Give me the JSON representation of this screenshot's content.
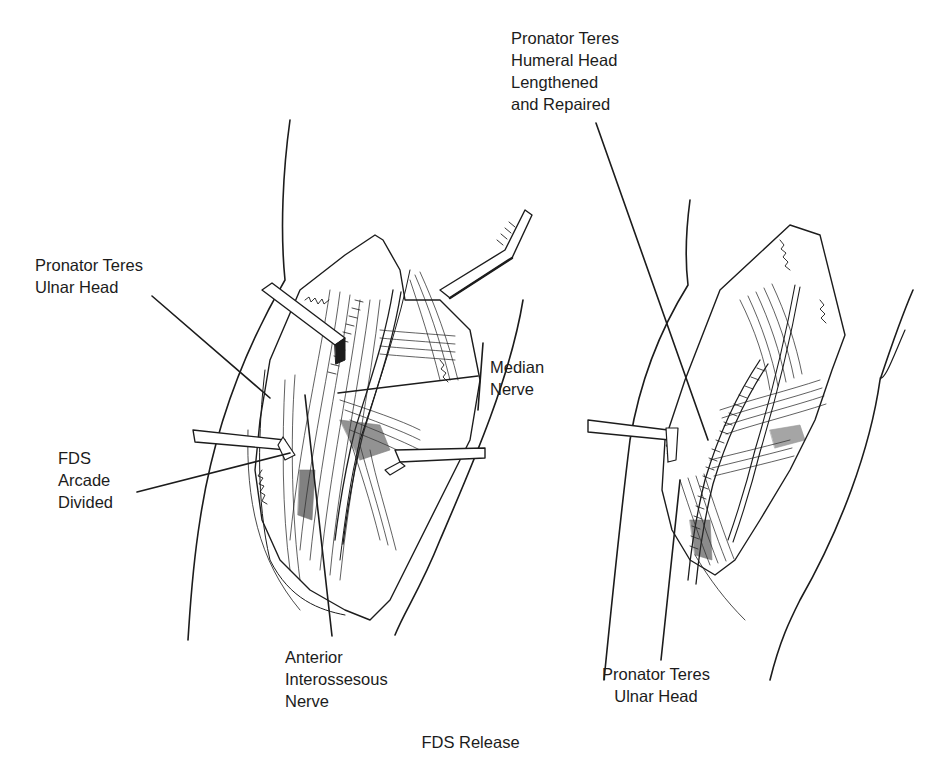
{
  "figure": {
    "caption": "FDS Release",
    "panels": [
      {
        "id": "left",
        "description": "Exposure before release",
        "labels": [
          {
            "id": "pronator-teres-ulnar-head-left",
            "lines": [
              "Pronator Teres",
              "Ulnar Head"
            ]
          },
          {
            "id": "fds-arcade-divided",
            "lines": [
              "FDS",
              "Arcade",
              "Divided"
            ]
          },
          {
            "id": "median-nerve",
            "lines": [
              "Median",
              "Nerve"
            ]
          },
          {
            "id": "anterior-interosseous-nerve",
            "lines": [
              "Anterior",
              "Interossesous",
              "Nerve"
            ]
          }
        ]
      },
      {
        "id": "right",
        "description": "After lengthening and repair",
        "labels": [
          {
            "id": "pronator-teres-humeral-head",
            "lines": [
              "Pronator Teres",
              "Humeral Head",
              "Lengthened",
              "and Repaired"
            ]
          },
          {
            "id": "pronator-teres-ulnar-head-right",
            "lines": [
              "Pronator Teres",
              "Ulnar Head"
            ]
          }
        ]
      }
    ],
    "colors": {
      "ink": "#1c1c1c",
      "background": "#ffffff"
    }
  }
}
